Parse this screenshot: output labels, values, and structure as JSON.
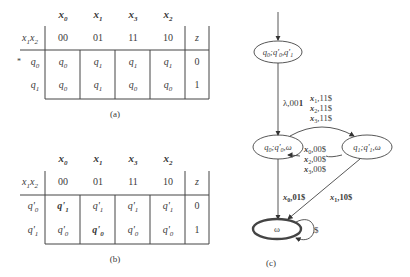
{
  "table_a": {
    "caption": "(a)",
    "column_symbols": [
      "x0",
      "x1",
      "x3",
      "x2"
    ],
    "row_header_label": "x1x2",
    "column_codes": [
      "00",
      "01",
      "11",
      "10"
    ],
    "output_label": "z",
    "rows": [
      {
        "marker": "*",
        "state": "q0",
        "cells": [
          "q0",
          "q1",
          "q1",
          "q1"
        ],
        "z": "0"
      },
      {
        "marker": "",
        "state": "q1",
        "cells": [
          "q0",
          "q1",
          "q0",
          "q0"
        ],
        "z": "1"
      }
    ]
  },
  "table_b": {
    "caption": "(b)",
    "column_symbols": [
      "x0",
      "x1",
      "x3",
      "x2"
    ],
    "row_header_label": "x1x2",
    "column_codes": [
      "00",
      "01",
      "11",
      "10"
    ],
    "output_label": "z",
    "rows": [
      {
        "state": "q'0",
        "cells": [
          "q'1",
          "q'1",
          "q'1",
          "q'1"
        ],
        "bold_cells": [
          0
        ],
        "z": "0"
      },
      {
        "state": "q'1",
        "cells": [
          "q'0",
          "q'0",
          "q'0",
          "q'0"
        ],
        "bold_cells": [
          1
        ],
        "z": "1"
      }
    ]
  },
  "diagram_c": {
    "caption": "(c)",
    "nodes": [
      {
        "id": "start",
        "label": "q0;q'0,q'1"
      },
      {
        "id": "n1",
        "label": "q0;q'0,ω"
      },
      {
        "id": "n2",
        "label": "q1;q'1,ω"
      },
      {
        "id": "final",
        "label": "ω",
        "accepting": true
      }
    ],
    "edges": [
      {
        "from": "start",
        "to": "n1",
        "label": "λ,001"
      },
      {
        "from": "n1",
        "to": "n2",
        "labels": [
          "x1,11$",
          "x2,11$",
          "x3,11$"
        ]
      },
      {
        "from": "n2",
        "to": "n1",
        "labels": [
          "x0,00$",
          "x2,00$",
          "x3,00$"
        ]
      },
      {
        "from": "n1",
        "to": "final",
        "label": "x0,01$"
      },
      {
        "from": "n2",
        "to": "final",
        "label": "x1,10$"
      },
      {
        "from": "final",
        "to": "final",
        "label": "$"
      }
    ]
  }
}
